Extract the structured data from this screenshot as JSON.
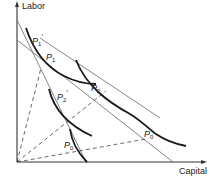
{
  "diagram": {
    "axes": {
      "y_label": "Labor",
      "x_label": "Capital"
    },
    "points": [
      {
        "id": "P1prime",
        "base": "P",
        "sub": "1",
        "prime": true
      },
      {
        "id": "P1",
        "base": "P",
        "sub": "1",
        "prime": false
      },
      {
        "id": "P2prime",
        "base": "P",
        "sub": "2",
        "prime": true
      },
      {
        "id": "P2",
        "base": "P",
        "sub": "2",
        "prime": false
      },
      {
        "id": "P0prime",
        "base": "P",
        "sub": "0",
        "prime": true
      },
      {
        "id": "P0",
        "base": "P",
        "sub": "0",
        "prime": false
      }
    ],
    "colors": {
      "curve": "#1a1a1a",
      "line": "#555555",
      "axis": "#333333"
    }
  }
}
